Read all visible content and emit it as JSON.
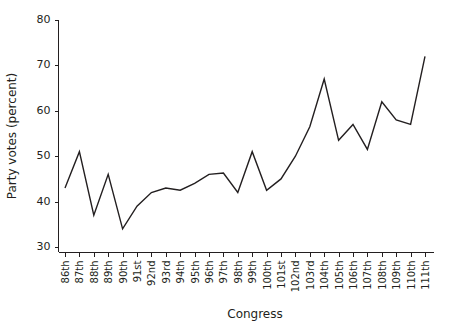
{
  "chart_data": {
    "type": "line",
    "title": "",
    "xlabel": "Congress",
    "ylabel": "Party votes (percent)",
    "categories": [
      "86th",
      "87th",
      "88th",
      "89th",
      "90th",
      "91st",
      "92nd",
      "93rd",
      "94th",
      "95th",
      "96th",
      "97th",
      "98th",
      "99th",
      "100th",
      "101st",
      "102nd",
      "103rd",
      "104th",
      "105th",
      "106th",
      "107th",
      "108th",
      "109th",
      "110th",
      "111th"
    ],
    "values": [
      43,
      51,
      37,
      46,
      34,
      39,
      42,
      43,
      42.5,
      44,
      46,
      46.3,
      42,
      51,
      42.5,
      45,
      50,
      56.5,
      67,
      53.5,
      57,
      51.5,
      62,
      58,
      57,
      72
    ],
    "series": [
      {
        "name": "Party votes",
        "values": [
          43,
          51,
          37,
          46,
          34,
          39,
          42,
          43,
          42.5,
          44,
          46,
          46.3,
          42,
          51,
          42.5,
          45,
          50,
          56.5,
          67,
          53.5,
          57,
          51.5,
          62,
          58,
          57,
          72
        ]
      }
    ],
    "ylim": [
      30,
      80
    ],
    "yticks": [
      30,
      40,
      50,
      60,
      70,
      80
    ],
    "ytick_labels": [
      "30",
      "40",
      "50",
      "60",
      "70",
      "80"
    ],
    "grid": false,
    "legend": false,
    "legend_position": "none",
    "line_color": "#231f20",
    "background_color": "#ffffff"
  }
}
